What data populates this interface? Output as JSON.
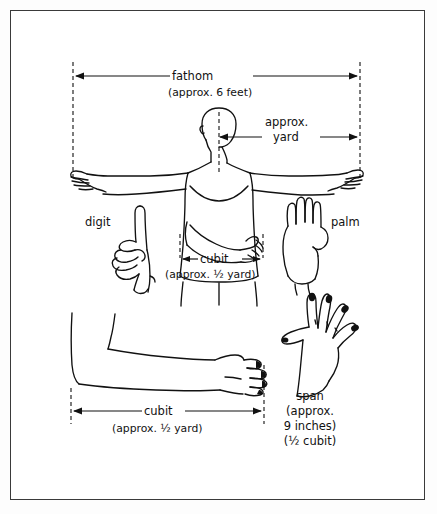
{
  "figure": {
    "background_color": "#ffffff",
    "frame_color": "#3a3a3a",
    "ink_color": "#111111"
  },
  "measures": {
    "fathom": {
      "name": "fathom",
      "approx": "(approx. 6 feet)",
      "dimension_label": "fathom",
      "span_description": "fingertip to fingertip, arms outstretched"
    },
    "yard": {
      "name": "approx.",
      "name_line2": "yard",
      "dimension_label": "approx. yard",
      "span_description": "center of body to fingertip"
    },
    "cubit_upper": {
      "name": "cubit",
      "approx": "(approx. 1/2 yard)"
    },
    "cubit_lower": {
      "name": "cubit",
      "approx": "(approx. 1/2 yard)"
    },
    "digit": {
      "name": "digit"
    },
    "palm": {
      "name": "palm"
    },
    "span": {
      "name": "span",
      "line2": "(approx.",
      "line3": "9 inches)",
      "line4": "(1/2 cubit)"
    }
  },
  "labels": {
    "fathom": "fathom",
    "fathom_approx": "(approx. 6 feet)",
    "yard_l1": "approx.",
    "yard_l2": "yard",
    "cubit_top": "cubit",
    "cubit_top_approx": "(approx. ½ yard)",
    "digit": "digit",
    "palm": "palm",
    "cubit_bottom": "cubit",
    "cubit_bottom_approx": "(approx. ½ yard)",
    "span": "span",
    "span_l2": "(approx.",
    "span_l3": "9 inches)",
    "span_l4": "(½ cubit)"
  }
}
